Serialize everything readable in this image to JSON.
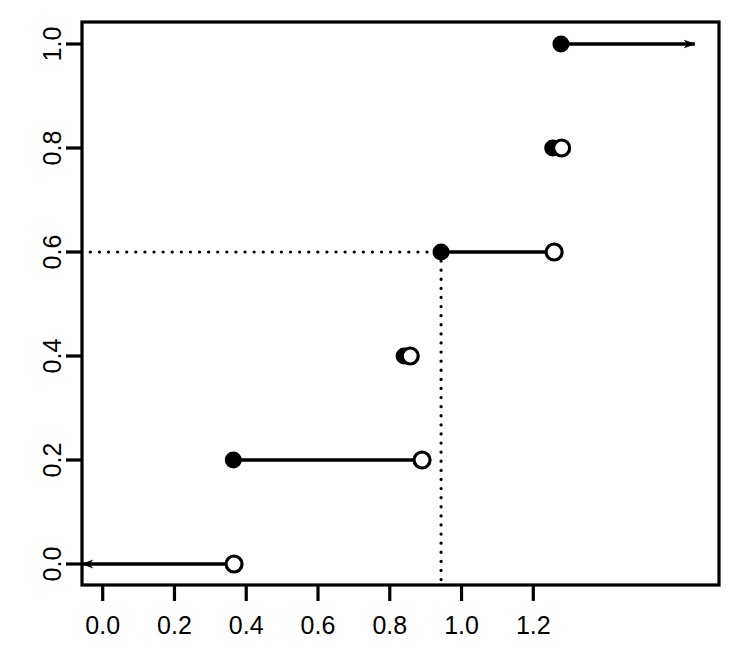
{
  "chart_data": {
    "type": "line",
    "subtype": "empirical-cdf-step",
    "title": "",
    "xlabel": "",
    "ylabel": "",
    "xlim": [
      -0.06,
      1.3
    ],
    "ylim": [
      -0.04,
      1.04
    ],
    "grid": false,
    "legend": null,
    "x_ticks": [
      0.0,
      0.2,
      0.4,
      0.6,
      0.8,
      1.0,
      1.2
    ],
    "x_tick_labels": [
      "0.0",
      "0.2",
      "0.4",
      "0.6",
      "0.8",
      "1.0",
      "1.2"
    ],
    "y_ticks": [
      0.0,
      0.2,
      0.4,
      0.6,
      0.8,
      1.0
    ],
    "y_tick_labels": [
      "0.0",
      "0.2",
      "0.4",
      "0.6",
      "0.8",
      "1.0"
    ],
    "y_tick_label_rotation": -90,
    "steps": [
      {
        "y": 0.0,
        "x_start": -0.06,
        "x_end": 0.366,
        "start_marker": "arrow-left",
        "end_marker": "open-circle"
      },
      {
        "y": 0.2,
        "x_start": 0.364,
        "x_end": 0.89,
        "start_marker": "filled-circle",
        "end_marker": "open-circle"
      },
      {
        "y": 0.4,
        "x_start": 0.84,
        "x_end": 0.857,
        "start_marker": "filled-circle",
        "end_marker": "open-circle"
      },
      {
        "y": 0.6,
        "x_start": 0.943,
        "x_end": 1.258,
        "start_marker": "filled-circle",
        "end_marker": "open-circle"
      },
      {
        "y": 0.8,
        "x_start": 1.254,
        "x_end": 1.279,
        "start_marker": "filled-circle",
        "end_marker": "open-circle"
      },
      {
        "y": 1.0,
        "x_start": 1.277,
        "x_end": 1.65,
        "start_marker": "filled-circle",
        "end_marker": "arrow-right"
      }
    ],
    "reference_lines": [
      {
        "orientation": "horizontal",
        "value": 0.6,
        "x_from": -0.06,
        "x_to": 0.943,
        "style": "dotted"
      },
      {
        "orientation": "vertical",
        "value": 0.943,
        "y_from": -0.03,
        "y_to": 0.6,
        "style": "dotted"
      }
    ],
    "annotations": [],
    "colors": {
      "line": "#000000",
      "marker_fill": "#000000",
      "marker_open_fill": "#ffffff",
      "axis": "#000000",
      "background": "#ffffff"
    }
  },
  "figure": {
    "box": {
      "left": 82,
      "top": 22,
      "right": 719,
      "bottom": 585
    },
    "px": {
      "x_axis": {
        "v0": 0.0,
        "px0": 102.7,
        "v1": 1.2,
        "px1": 533.3
      },
      "y_axis": {
        "v0": 0.0,
        "px0": 564,
        "v1": 1.0,
        "px1": 44
      }
    }
  }
}
